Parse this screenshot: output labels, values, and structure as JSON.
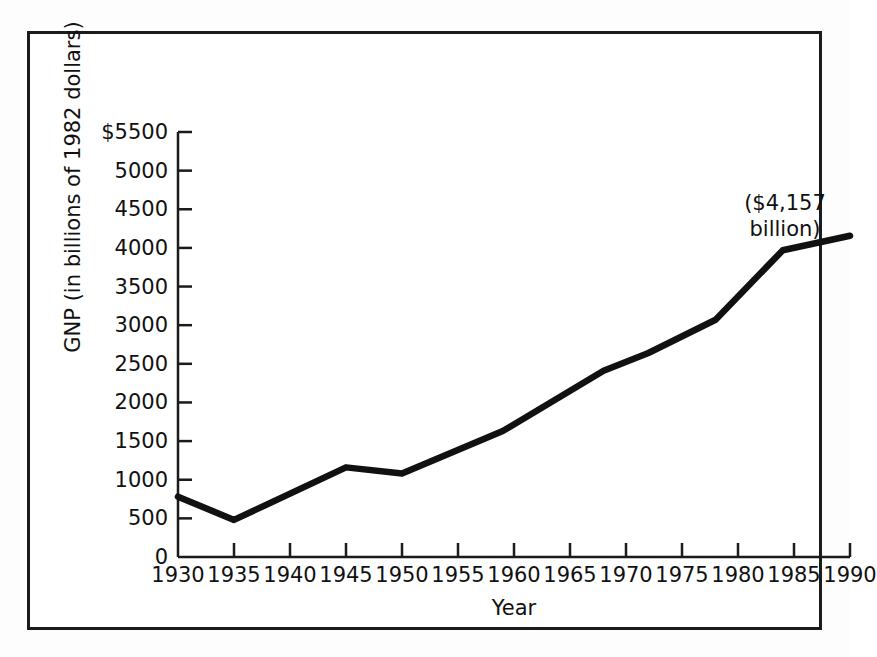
{
  "chart_data": {
    "type": "line",
    "title": "",
    "xlabel": "Year",
    "ylabel": "GNP (in billions of 1982 dollars)",
    "xlim": [
      1930,
      1990
    ],
    "ylim": [
      0,
      5500
    ],
    "grid": false,
    "legend": "none",
    "line_color": "#111111",
    "x_ticks": [
      1930,
      1935,
      1940,
      1945,
      1950,
      1955,
      1960,
      1965,
      1970,
      1975,
      1980,
      1985,
      1990
    ],
    "x_tick_labels": [
      "1930",
      "1935",
      "1940",
      "1945",
      "1950",
      "1955",
      "1960",
      "1965",
      "1970",
      "1975",
      "1980",
      "1985",
      "1990"
    ],
    "y_ticks": [
      0,
      500,
      1000,
      1500,
      2000,
      2500,
      3000,
      3500,
      4000,
      4500,
      5000,
      5500
    ],
    "y_tick_labels": [
      "0",
      "500",
      "1000",
      "1500",
      "2000",
      "2500",
      "3000",
      "3500",
      "4000",
      "4500",
      "5000",
      "$5500"
    ],
    "series": [
      {
        "name": "GNP",
        "x": [
          1930,
          1935,
          1945,
          1950,
          1959,
          1968,
          1972,
          1978,
          1984,
          1990
        ],
        "values": [
          780,
          480,
          1160,
          1080,
          1630,
          2410,
          2640,
          3070,
          3970,
          4157
        ]
      }
    ],
    "annotations": [
      {
        "name": "final-value",
        "lines": [
          "($4,157",
          "billion)"
        ],
        "text": "($4,157 billion)",
        "x": 1990,
        "y": 4157
      }
    ]
  },
  "axis": {
    "y_title": "GNP (in billions of 1982 dollars)",
    "x_title": "Year"
  },
  "annotation": {
    "line1": "($4,157",
    "line2": "billion)"
  }
}
